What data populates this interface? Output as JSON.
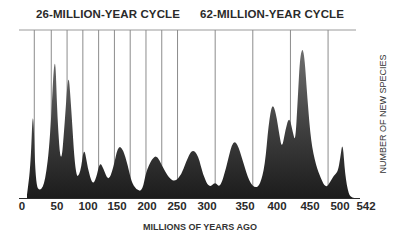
{
  "chart_data": {
    "type": "area",
    "title": "",
    "annotations": [
      "26-MILLION-YEAR CYCLE",
      "62-MILLION-YEAR CYCLE"
    ],
    "xlabel": "MILLIONS OF YEARS AGO",
    "ylabel": "NUMBER OF NEW SPECIES",
    "x_ticks": [
      "0",
      "50",
      "100",
      "150",
      "200",
      "250",
      "300",
      "350",
      "400",
      "450",
      "500",
      "542"
    ],
    "xlim": [
      0,
      542
    ],
    "ylim": [
      0,
      100
    ],
    "grid": false,
    "legend": null,
    "cycle_lines_26myr": [
      12,
      40,
      66,
      92,
      118,
      144,
      170,
      196,
      222,
      248
    ],
    "cycle_lines_62myr": [
      310,
      372,
      434,
      496
    ],
    "series": [
      {
        "name": "Number of new species (relative)",
        "x": [
          0,
          6,
          10,
          14,
          22,
          30,
          38,
          46,
          50,
          56,
          62,
          68,
          72,
          80,
          88,
          94,
          100,
          108,
          114,
          120,
          126,
          134,
          142,
          150,
          158,
          166,
          172,
          180,
          190,
          196,
          206,
          214,
          222,
          234,
          244,
          254,
          262,
          272,
          282,
          290,
          300,
          310,
          318,
          328,
          338,
          346,
          356,
          366,
          376,
          384,
          392,
          398,
          404,
          410,
          416,
          420,
          426,
          432,
          438,
          442,
          446,
          450,
          456,
          462,
          468,
          476,
          484,
          492,
          500,
          506,
          512,
          516,
          520,
          524,
          530,
          536,
          542
        ],
        "values": [
          2,
          20,
          60,
          8,
          4,
          10,
          35,
          95,
          48,
          18,
          45,
          78,
          60,
          12,
          15,
          32,
          18,
          8,
          12,
          22,
          18,
          10,
          18,
          32,
          30,
          20,
          10,
          5,
          4,
          16,
          24,
          26,
          20,
          12,
          10,
          14,
          22,
          30,
          26,
          14,
          6,
          10,
          6,
          18,
          34,
          34,
          22,
          10,
          6,
          8,
          20,
          45,
          58,
          52,
          38,
          30,
          42,
          50,
          40,
          34,
          60,
          88,
          92,
          60,
          34,
          20,
          12,
          6,
          10,
          14,
          16,
          24,
          35,
          14,
          2,
          0,
          0
        ]
      }
    ]
  },
  "labels": {
    "cycle26": "26-MILLION-YEAR CYCLE",
    "cycle62": "62-MILLION-YEAR CYCLE",
    "xlabel": "MILLIONS OF YEARS AGO",
    "ylabel": "NUMBER OF NEW SPECIES",
    "ticks": [
      "0",
      "50",
      "100",
      "150",
      "200",
      "250",
      "300",
      "350",
      "400",
      "450",
      "500",
      "542"
    ]
  },
  "colors": {
    "fill_top": "#6a6a6a",
    "fill_bottom": "#1e1e1e",
    "lines": "#8a8a8a",
    "text": "#2a2a2a"
  }
}
